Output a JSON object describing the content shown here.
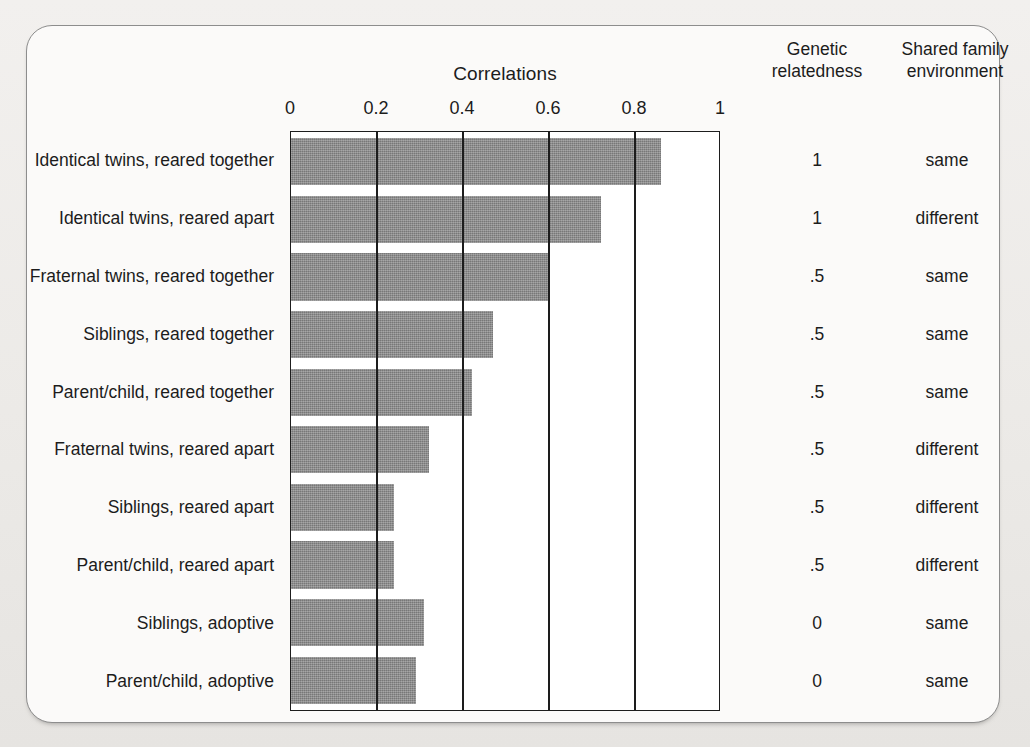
{
  "chart_data": {
    "type": "bar",
    "orientation": "horizontal",
    "title": "Correlations",
    "xlabel": "",
    "ylabel": "",
    "xlim": [
      0,
      1
    ],
    "xticks": [
      "0",
      "0.2",
      "0.4",
      "0.6",
      "0.8",
      "1"
    ],
    "xtick_values": [
      0,
      0.2,
      0.4,
      0.6,
      0.8,
      1
    ],
    "grid": true,
    "legend": "none",
    "bar_color": "#858585",
    "categories": [
      "Identical twins, reared together",
      "Identical twins, reared apart",
      "Fraternal twins, reared together",
      "Siblings, reared together",
      "Parent/child, reared together",
      "Fraternal twins, reared apart",
      "Siblings, reared apart",
      "Parent/child, reared apart",
      "Siblings, adoptive",
      "Parent/child, adoptive"
    ],
    "values": [
      0.86,
      0.72,
      0.6,
      0.47,
      0.42,
      0.32,
      0.24,
      0.24,
      0.31,
      0.29
    ],
    "extra_columns": [
      {
        "header": "Genetic relatedness",
        "header_line1": "Genetic",
        "header_line2": "relatedness",
        "values": [
          "1",
          "1",
          ".5",
          ".5",
          ".5",
          ".5",
          ".5",
          ".5",
          "0",
          "0"
        ]
      },
      {
        "header": "Shared family environment",
        "header_line1": "Shared family",
        "header_line2": "environment",
        "values": [
          "same",
          "different",
          "same",
          "same",
          "same",
          "different",
          "different",
          "different",
          "same",
          "same"
        ]
      }
    ]
  }
}
